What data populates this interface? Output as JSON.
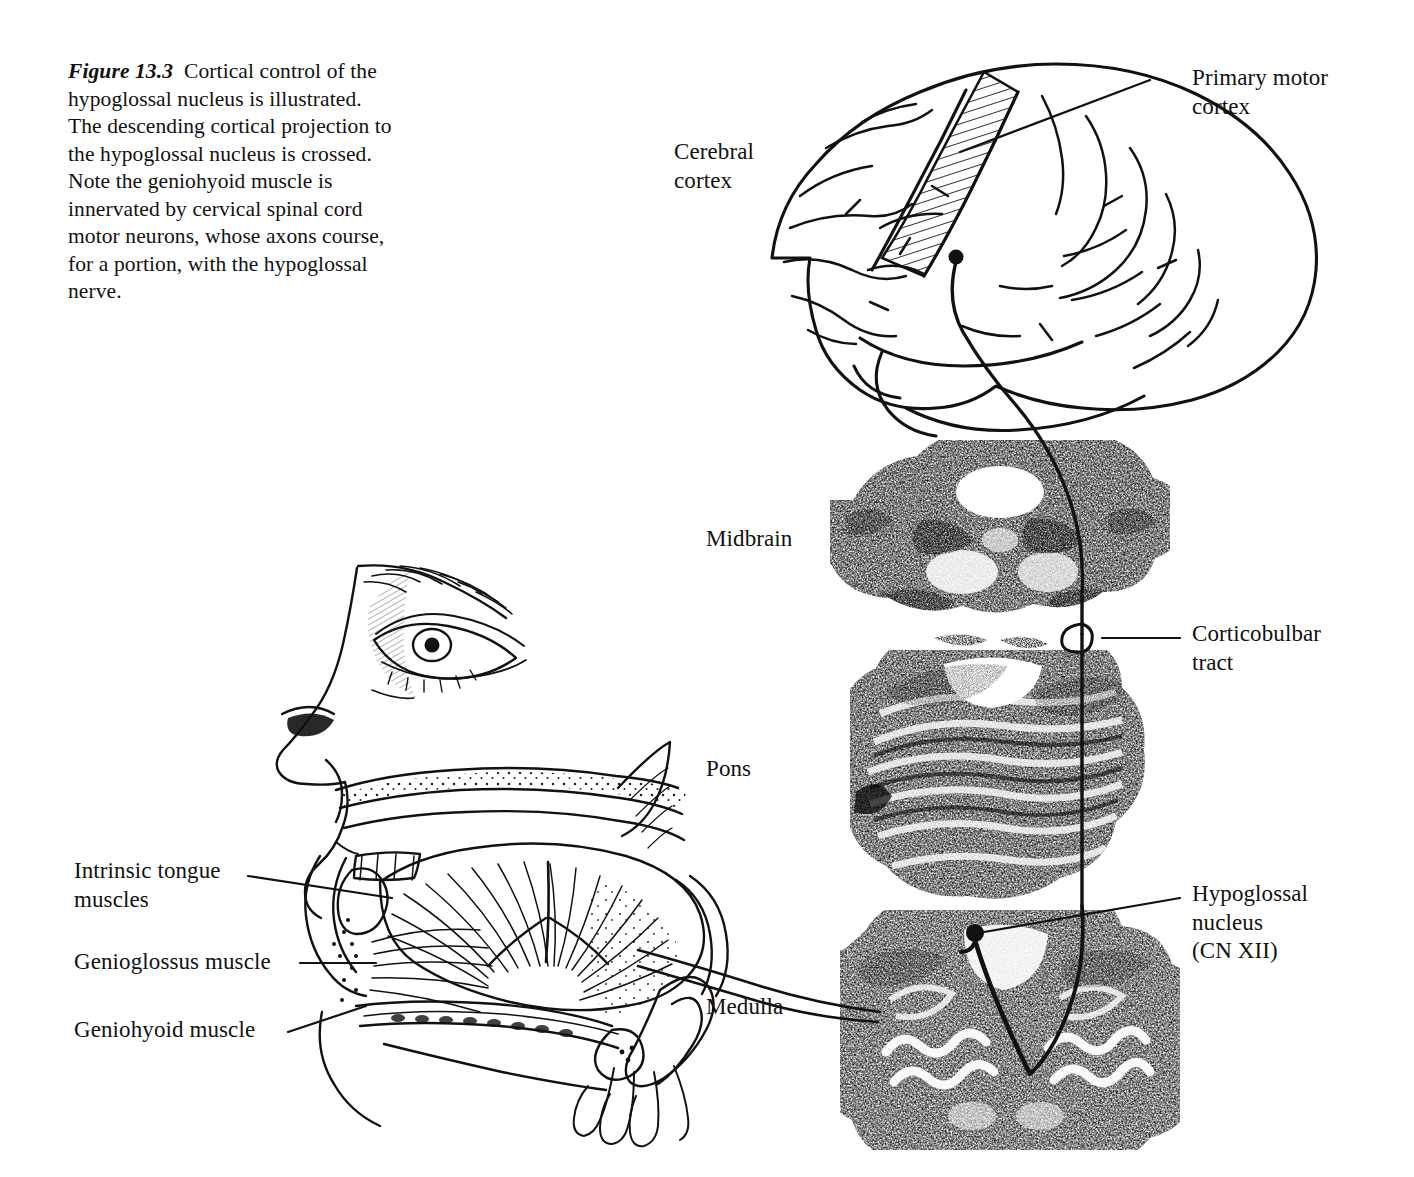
{
  "figure": {
    "number": "Figure 13.3",
    "caption": "Cortical control of the hypoglossal nucleus is illustrated. The descending cortical projection to the hypoglossal nucleus is crossed. Note the geniohyoid muscle is innervated by cervical spinal cord motor neurons, whose axons course, for a portion, with the hypoglossal nerve."
  },
  "colors": {
    "ink": "#111111",
    "paper": "#ffffff",
    "stipple": "#2a2a2a"
  },
  "labels": {
    "cerebral_cortex": "Cerebral\ncortex",
    "midbrain": "Midbrain",
    "pons": "Pons",
    "medulla": "Medulla",
    "primary_motor_cortex": "Primary motor\ncortex",
    "corticobulbar_tract": "Corticobulbar\ntract",
    "hypoglossal_nucleus": "Hypoglossal\nnucleus\n(CN XII)",
    "intrinsic_tongue_muscles": "Intrinsic tongue\nmuscles",
    "genioglossus_muscle": "Genioglossus muscle",
    "geniohyoid_muscle": "Geniohyoid muscle"
  },
  "diagram": {
    "type": "anatomical-illustration",
    "panels": [
      {
        "name": "sagittal-head",
        "content": "Mid-sagittal view of human head showing nose, eye, palate, tongue musculature, mandible, hyoid and hypoglossal nerve"
      },
      {
        "name": "lateral-brain",
        "content": "Lateral view of cerebral hemisphere with hatched precentral gyrus marking primary motor cortex"
      },
      {
        "name": "midbrain-section",
        "content": "Transverse histological section of the midbrain"
      },
      {
        "name": "pons-section",
        "content": "Transverse histological section of the pons"
      },
      {
        "name": "medulla-section",
        "content": "Transverse histological section of the medulla with hypoglossal nucleus"
      }
    ],
    "pathway": {
      "name": "corticobulbar projection",
      "description": "Upper motor neuron in primary motor cortex descends through midbrain and pons as the corticobulbar tract, decussates in the medulla and synapses on the contralateral hypoglossal nucleus (CN XII); the hypoglossal nerve then courses to the tongue muscles.",
      "crossed": true
    }
  }
}
